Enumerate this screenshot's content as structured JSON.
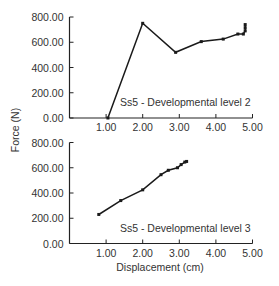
{
  "chart_data": [
    {
      "type": "line",
      "title": "Ss5 - Developmental level 2",
      "xlabel": "",
      "ylabel": "Force (N)",
      "xlim": [
        0,
        5
      ],
      "ylim": [
        0,
        800
      ],
      "xticks": [
        "1.00",
        "2.00",
        "3.00",
        "4.00",
        "5.00"
      ],
      "yticks": [
        "0.00",
        "200.00",
        "400.00",
        "600.00",
        "800.00"
      ],
      "grid": false,
      "series": [
        {
          "name": "Ss5 - Developmental level 2",
          "x": [
            1.05,
            2.0,
            2.9,
            3.6,
            4.2,
            4.6,
            4.75,
            4.8,
            4.8,
            4.8
          ],
          "y": [
            0,
            750,
            520,
            605,
            625,
            665,
            665,
            690,
            715,
            740
          ]
        }
      ]
    },
    {
      "type": "line",
      "title": "Ss5 - Developmental level 3",
      "xlabel": "Displacement (cm)",
      "ylabel": "Force (N)",
      "xlim": [
        0,
        5
      ],
      "ylim": [
        0,
        800
      ],
      "xticks": [
        "1.00",
        "2.00",
        "3.00",
        "4.00",
        "5.00"
      ],
      "yticks": [
        "0.00",
        "200.00",
        "400.00",
        "600.00",
        "800.00"
      ],
      "grid": false,
      "series": [
        {
          "name": "Ss5 - Developmental level 3",
          "x": [
            0.8,
            1.4,
            2.0,
            2.5,
            2.7,
            2.95,
            3.05,
            3.15,
            3.2
          ],
          "y": [
            230,
            340,
            425,
            545,
            580,
            600,
            625,
            645,
            650
          ]
        }
      ]
    }
  ],
  "labels": {
    "y_axis": "Force (N)",
    "x_axis": "Displacement (cm)",
    "chart1_legend": "Ss5 - Developmental level 2",
    "chart2_legend": "Ss5 - Developmental level 3"
  }
}
